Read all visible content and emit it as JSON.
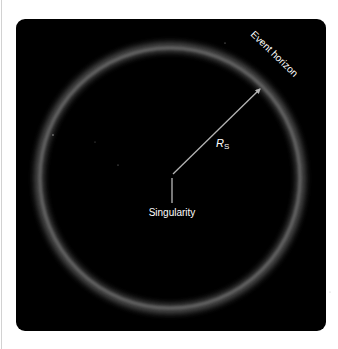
{
  "diagram": {
    "labels": {
      "event_horizon": "Event horizon",
      "radius_symbol": "R",
      "radius_subscript": "S",
      "singularity": "Singularity"
    },
    "colors": {
      "background": "#000000",
      "page": "#ffffff",
      "ring_glow": "#8a8a8a",
      "arrow": "#b4b4b4",
      "text": "#ffffff"
    }
  }
}
